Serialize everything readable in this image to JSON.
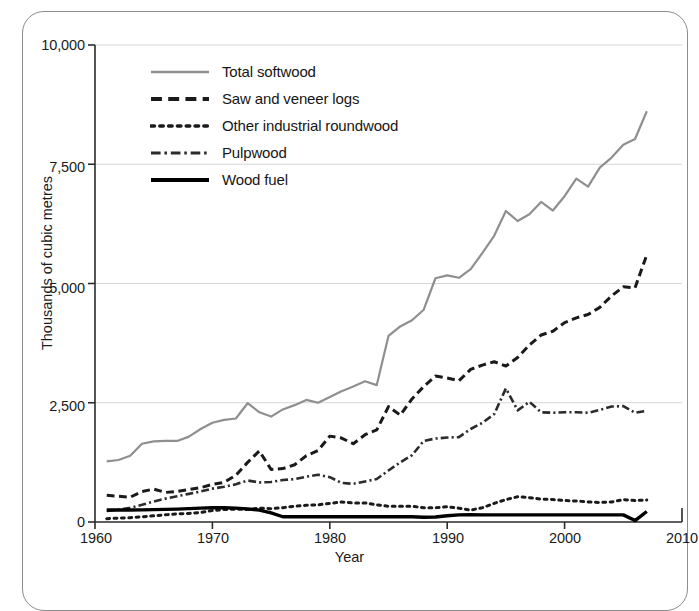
{
  "chart_data": {
    "type": "line",
    "title": "",
    "xlabel": "Year",
    "ylabel": "Thousands of cubic metres",
    "xlim": [
      1960,
      2010
    ],
    "ylim": [
      0,
      10000
    ],
    "xticks": [
      "1960",
      "1970",
      "1980",
      "1990",
      "2000",
      "2010"
    ],
    "xtick_values": [
      1960,
      1970,
      1980,
      1990,
      2000,
      2010
    ],
    "yticks": [
      "0",
      "2,500",
      "5,000",
      "7,500",
      "10,000"
    ],
    "ytick_values": [
      0,
      2500,
      5000,
      7500,
      10000
    ],
    "grid": "horizontal",
    "legend_position": "upper-left-inside",
    "x": [
      1961,
      1962,
      1963,
      1964,
      1965,
      1966,
      1967,
      1968,
      1969,
      1970,
      1971,
      1972,
      1973,
      1974,
      1975,
      1976,
      1977,
      1978,
      1979,
      1980,
      1981,
      1982,
      1983,
      1984,
      1985,
      1986,
      1987,
      1988,
      1989,
      1990,
      1991,
      1992,
      1993,
      1994,
      1995,
      1996,
      1997,
      1998,
      1999,
      2000,
      2001,
      2002,
      2003,
      2004,
      2005,
      2006,
      2007
    ],
    "series": [
      {
        "name": "Total softwood",
        "style": "solid",
        "color": "#8f8f8f",
        "width": 2.2,
        "values": [
          1270,
          1300,
          1390,
          1640,
          1690,
          1700,
          1700,
          1790,
          1950,
          2080,
          2140,
          2170,
          2490,
          2300,
          2210,
          2360,
          2450,
          2560,
          2500,
          2620,
          2740,
          2840,
          2950,
          2870,
          3900,
          4100,
          4230,
          4450,
          5110,
          5170,
          5120,
          5300,
          5640,
          6000,
          6520,
          6310,
          6450,
          6710,
          6530,
          6830,
          7200,
          7030,
          7430,
          7640,
          7910,
          8030,
          8610
        ]
      },
      {
        "name": "Saw and veneer logs",
        "style": "dashed",
        "color": "#1a1a1a",
        "width": 3.0,
        "values": [
          560,
          540,
          520,
          640,
          690,
          620,
          640,
          680,
          720,
          790,
          830,
          980,
          1250,
          1490,
          1100,
          1120,
          1200,
          1390,
          1500,
          1800,
          1760,
          1640,
          1830,
          1930,
          2420,
          2240,
          2580,
          2840,
          3060,
          3020,
          2960,
          3200,
          3290,
          3360,
          3270,
          3450,
          3710,
          3920,
          4000,
          4180,
          4280,
          4350,
          4500,
          4740,
          4930,
          4910,
          5600
        ]
      },
      {
        "name": "Other industrial roundwood",
        "style": "dotted",
        "color": "#1a1a1a",
        "width": 3.0,
        "values": [
          70,
          80,
          90,
          110,
          130,
          150,
          170,
          180,
          200,
          240,
          260,
          270,
          260,
          290,
          280,
          300,
          330,
          350,
          360,
          390,
          420,
          400,
          400,
          360,
          330,
          330,
          330,
          300,
          300,
          320,
          290,
          250,
          300,
          390,
          470,
          530,
          510,
          480,
          470,
          450,
          440,
          420,
          410,
          420,
          470,
          450,
          460
        ]
      },
      {
        "name": "Pulpwood",
        "style": "dashdot",
        "color": "#2b2b2b",
        "width": 2.6,
        "values": [
          230,
          260,
          300,
          360,
          430,
          490,
          540,
          590,
          640,
          700,
          740,
          790,
          870,
          830,
          840,
          880,
          900,
          950,
          990,
          940,
          820,
          800,
          850,
          900,
          1080,
          1250,
          1400,
          1700,
          1750,
          1770,
          1780,
          1950,
          2080,
          2260,
          2800,
          2340,
          2520,
          2300,
          2290,
          2300,
          2300,
          2290,
          2350,
          2420,
          2430,
          2290,
          2330
        ]
      },
      {
        "name": "Wood fuel",
        "style": "solid",
        "color": "#000000",
        "width": 3.4,
        "values": [
          250,
          250,
          250,
          255,
          260,
          265,
          270,
          280,
          290,
          300,
          300,
          290,
          275,
          250,
          190,
          110,
          110,
          110,
          110,
          110,
          110,
          110,
          110,
          110,
          110,
          110,
          110,
          100,
          105,
          130,
          150,
          155,
          150,
          150,
          150,
          150,
          150,
          150,
          150,
          150,
          150,
          150,
          150,
          150,
          150,
          30,
          220
        ]
      }
    ]
  },
  "legend": {
    "items": [
      {
        "label": "Total softwood",
        "style": "solid",
        "color": "#8f8f8f",
        "width": 2.4
      },
      {
        "label": "Saw and veneer logs",
        "style": "dashed",
        "color": "#1a1a1a",
        "width": 4.2
      },
      {
        "label": "Other industrial roundwood",
        "style": "dotted",
        "color": "#1a1a1a",
        "width": 3.6
      },
      {
        "label": "Pulpwood",
        "style": "dashdot",
        "color": "#2b2b2b",
        "width": 3.2
      },
      {
        "label": "Wood fuel",
        "style": "solid",
        "color": "#000000",
        "width": 4.2
      }
    ]
  },
  "axes": {
    "y_title": "Thousands of cubic metres",
    "x_title": "Year",
    "y_tick_labels": [
      "10,000",
      "7,500",
      "5,000",
      "2,500",
      "0"
    ],
    "x_tick_labels": [
      "1960",
      "1970",
      "1980",
      "1990",
      "2000",
      "2010"
    ]
  },
  "colors": {
    "gridline": "#d6d6d6",
    "axis": "#2b2b2b",
    "frame": "#8c8c8c",
    "background": "#ffffff"
  }
}
